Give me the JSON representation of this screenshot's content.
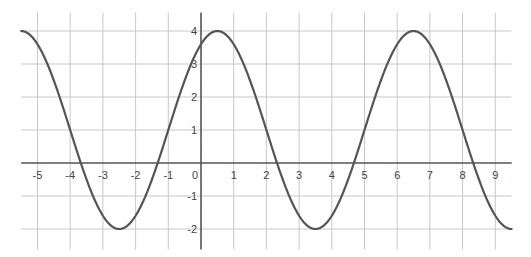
{
  "chart_data": {
    "type": "line",
    "title": "",
    "xlabel": "",
    "ylabel": "",
    "xlim": [
      -5.5,
      9.5
    ],
    "ylim": [
      -2.5,
      4.5
    ],
    "grid": true,
    "legend": null,
    "x_ticks": [
      -5,
      -4,
      -3,
      -2,
      -1,
      0,
      1,
      2,
      3,
      4,
      5,
      6,
      7,
      8,
      9
    ],
    "y_ticks": [
      -2,
      -1,
      1,
      2,
      3,
      4
    ],
    "series": [
      {
        "name": "f(x)",
        "equation": "y = 3*cos((pi/3)*(x - 0.5)) + 1",
        "amplitude": 3,
        "period": 6,
        "midline": 1,
        "max": 4,
        "min": -2,
        "maxima_x": [
          -5.5,
          0.5,
          6.5
        ],
        "minima_x": [
          -2.5,
          3.5,
          9.5
        ],
        "zeros_x": [
          -3.68,
          -1.32,
          2.32,
          4.68,
          8.32
        ],
        "y_intercept": 3.6,
        "color": "#555555"
      }
    ]
  },
  "layout": {
    "origin_px": [
      201,
      163
    ],
    "px_per_unit_x": 32.7,
    "px_per_unit_y": 33.0,
    "grid_color": "#c8c8c8",
    "axis_color": "#555555"
  }
}
